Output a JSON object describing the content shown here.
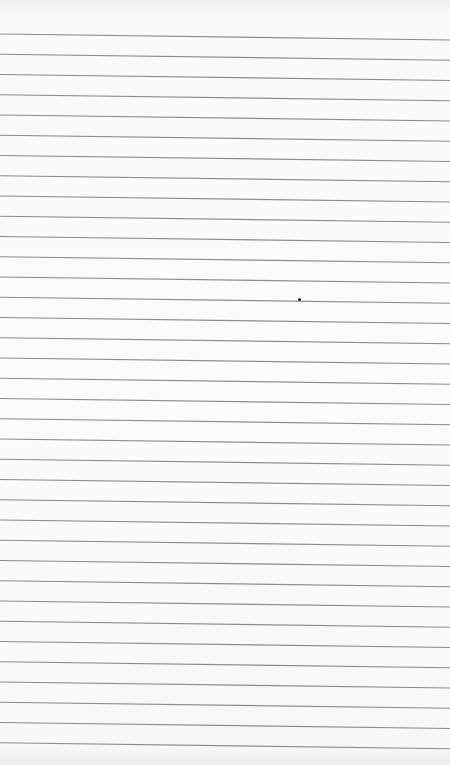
{
  "image": {
    "subject": "ruled notebook paper",
    "line_count": 36,
    "first_line_y_left": 34,
    "line_spacing": 20.25,
    "line_slant_px": 6,
    "line_color": "#8c8c8c",
    "paper_color": "#fafafa",
    "dot": {
      "x": 299,
      "y": 299,
      "color": "#222222"
    }
  }
}
